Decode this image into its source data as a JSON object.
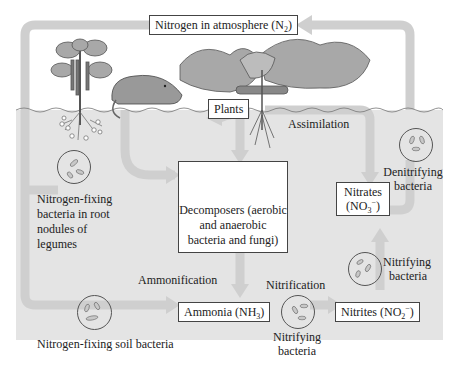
{
  "diagram": {
    "atmosphere": {
      "label": "Nitrogen in atmosphere (N",
      "sub": "2",
      "suffix": ")"
    },
    "plants": {
      "label": "Plants"
    },
    "assimilation": {
      "label": "Assimilation"
    },
    "legume_bacteria": {
      "lines": [
        "Nitrogen-fixing",
        "bacteria in root",
        "nodules of",
        "legumes"
      ]
    },
    "decomposers": {
      "lines": [
        "Decomposers (aerobic",
        "and anaerobic",
        "bacteria and fungi)"
      ]
    },
    "denitrifying": {
      "lines": [
        "Denitrifying",
        "bacteria"
      ]
    },
    "nitrates": {
      "line1": "Nitrates",
      "line2_prefix": "(NO",
      "line2_sub": "3",
      "line2_sup": "−",
      "line2_suffix": ")"
    },
    "nitrifying_right": {
      "lines": [
        "Nitrifying",
        "bacteria"
      ]
    },
    "ammonification": {
      "label": "Ammonification"
    },
    "nitrification": {
      "label": "Nitrification"
    },
    "ammonia": {
      "prefix": "Ammonia (NH",
      "sub": "3",
      "suffix": ")"
    },
    "nitrites": {
      "prefix": "Nitrites (NO",
      "sub": "2",
      "sup": "−",
      "suffix": ")"
    },
    "nitrifying_bottom": {
      "lines": [
        "Nitrifying",
        "bacteria"
      ]
    },
    "soil_bacteria": {
      "label": "Nitrogen-fixing soil bacteria"
    },
    "colors": {
      "soil": "#e4e4e4",
      "arrow": "#cfcfcf",
      "box_border": "#444444",
      "foliage": "#9a9a9a"
    }
  }
}
